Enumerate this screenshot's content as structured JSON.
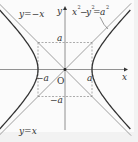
{
  "diagram": {
    "equation": {
      "base": "x",
      "exp1": "2",
      "minus": "−",
      "base2": "y",
      "exp2": "2",
      "eq": "=",
      "base3": "a",
      "exp3": "2"
    },
    "axes": {
      "x_label": "x",
      "y_label": "y",
      "origin_label": "O"
    },
    "asymptotes": [
      {
        "label": "y=−x",
        "slope": -1
      },
      {
        "label": "y=x",
        "slope": 1
      }
    ],
    "tick_labels": {
      "pos_x": "a",
      "neg_x": "−a",
      "pos_y": "a",
      "neg_y": "−a"
    },
    "params": {
      "a": 1
    },
    "colors": {
      "curve": "#333333",
      "axis": "#777777",
      "asymptote": "#888888",
      "dashed": "#777777",
      "background": "#fbfbfb"
    }
  }
}
